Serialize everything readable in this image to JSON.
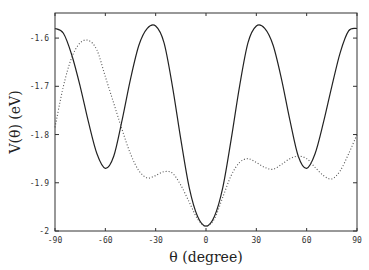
{
  "chart_data": {
    "type": "line",
    "title": "",
    "xlabel": "θ (degree)",
    "ylabel": "V(θ) (eV)",
    "xlim": [
      -90,
      90
    ],
    "ylim": [
      -2.0,
      -1.548
    ],
    "xticks": [
      -90,
      -60,
      -30,
      0,
      30,
      60,
      90
    ],
    "yticks": [
      -1.6,
      -1.7,
      -1.8,
      -1.9,
      -2
    ],
    "xtick_labels": [
      "-90",
      "-60",
      "-30",
      "0",
      "30",
      "60",
      "90"
    ],
    "ytick_labels": [
      "-1.6",
      "-1.7",
      "-1.8",
      "-1.9",
      "-2"
    ],
    "grid": false,
    "legend": null,
    "series": [
      {
        "name": "solid",
        "style": "solid",
        "color": "#222222",
        "x": [
          -90,
          -85,
          -80,
          -75,
          -70,
          -65,
          -60,
          -55,
          -50,
          -45,
          -40,
          -35,
          -30,
          -25,
          -20,
          -15,
          -10,
          -5,
          0,
          5,
          10,
          15,
          20,
          25,
          30,
          35,
          40,
          45,
          50,
          55,
          60,
          65,
          70,
          75,
          80,
          85,
          90
        ],
        "y": [
          -1.58,
          -1.59,
          -1.635,
          -1.7,
          -1.775,
          -1.84,
          -1.87,
          -1.845,
          -1.77,
          -1.685,
          -1.615,
          -1.58,
          -1.575,
          -1.61,
          -1.7,
          -1.81,
          -1.91,
          -1.97,
          -1.99,
          -1.97,
          -1.91,
          -1.81,
          -1.7,
          -1.61,
          -1.575,
          -1.58,
          -1.615,
          -1.685,
          -1.77,
          -1.845,
          -1.87,
          -1.84,
          -1.775,
          -1.7,
          -1.63,
          -1.585,
          -1.58
        ]
      },
      {
        "name": "dotted",
        "style": "dotted",
        "color": "#555555",
        "x": [
          -90,
          -85,
          -80,
          -75,
          -70,
          -65,
          -60,
          -55,
          -50,
          -45,
          -40,
          -35,
          -30,
          -25,
          -20,
          -15,
          -10,
          -5,
          0,
          5,
          10,
          15,
          20,
          25,
          30,
          35,
          40,
          45,
          50,
          55,
          60,
          65,
          70,
          75,
          80,
          85,
          90
        ],
        "y": [
          -1.785,
          -1.7,
          -1.64,
          -1.61,
          -1.605,
          -1.625,
          -1.68,
          -1.735,
          -1.79,
          -1.84,
          -1.875,
          -1.89,
          -1.885,
          -1.877,
          -1.88,
          -1.905,
          -1.94,
          -1.975,
          -1.99,
          -1.975,
          -1.93,
          -1.885,
          -1.858,
          -1.85,
          -1.858,
          -1.868,
          -1.872,
          -1.862,
          -1.85,
          -1.845,
          -1.85,
          -1.868,
          -1.885,
          -1.892,
          -1.875,
          -1.84,
          -1.8
        ]
      }
    ]
  }
}
